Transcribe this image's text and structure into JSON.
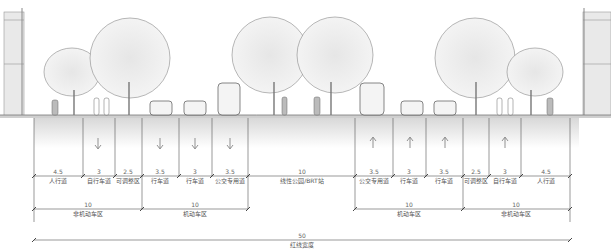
{
  "diagram": {
    "type": "road-cross-section",
    "segments": [
      {
        "label": "人行道",
        "width": "4.5"
      },
      {
        "label": "自行车道",
        "width": "3"
      },
      {
        "label": "可调整区",
        "width": "2.5"
      },
      {
        "label": "行车道",
        "width": "3.5"
      },
      {
        "label": "行车道",
        "width": "3"
      },
      {
        "label": "公交专用道",
        "width": "3.5"
      },
      {
        "label": "线性公园/BRT站",
        "width": "10"
      },
      {
        "label": "公交专用道",
        "width": "3.5"
      },
      {
        "label": "行车道",
        "width": "3"
      },
      {
        "label": "行车道",
        "width": "3.5"
      },
      {
        "label": "可调整区",
        "width": "2.5"
      },
      {
        "label": "自行车道",
        "width": "3"
      },
      {
        "label": "人行道",
        "width": "4.5"
      }
    ],
    "groups": [
      {
        "label": "非机动车区",
        "width": "10"
      },
      {
        "label": "机动车区",
        "width": "10"
      },
      {
        "label": "机动车区",
        "width": "10"
      },
      {
        "label": "非机动车区",
        "width": "10"
      }
    ],
    "total": {
      "label": "红线宽度",
      "width": "50"
    },
    "direction_arrows": [
      "down",
      "down",
      "down",
      "down",
      "up",
      "up",
      "up",
      "up"
    ]
  }
}
